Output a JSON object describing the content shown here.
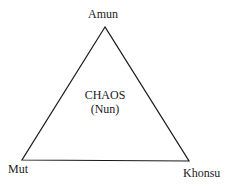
{
  "diagram": {
    "type": "triangle",
    "vertices": {
      "top": "Amun",
      "bottom_left": "Mut",
      "bottom_right": "Khonsu"
    },
    "center": {
      "line1": "CHAOS",
      "line2": "(Nun)"
    },
    "stroke_color": "#1a1a1a",
    "background": "#ffffff"
  }
}
